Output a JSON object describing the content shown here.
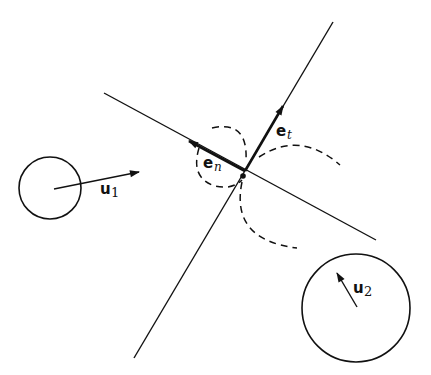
{
  "diagram": {
    "type": "collision-geometry",
    "colors": {
      "stroke": "#111111",
      "background": "#ffffff"
    },
    "labels": {
      "e_n": {
        "base": "e",
        "sub": "n"
      },
      "e_t": {
        "base": "e",
        "sub": "t"
      },
      "u_1": {
        "base": "u",
        "sub": "1"
      },
      "u_2": {
        "base": "u",
        "sub": "2"
      }
    },
    "elements": [
      {
        "id": "tangent-line",
        "kind": "line",
        "from": [
          104,
          93
        ],
        "to": [
          376,
          240
        ]
      },
      {
        "id": "normal-line",
        "kind": "line",
        "from": [
          333,
          22
        ],
        "to": [
          134,
          358
        ]
      },
      {
        "id": "vector-e_n",
        "kind": "arrow",
        "from": [
          245,
          171
        ],
        "to": [
          187,
          140
        ]
      },
      {
        "id": "vector-e_t",
        "kind": "arrow",
        "from": [
          245,
          171
        ],
        "to": [
          284,
          104
        ]
      },
      {
        "id": "particle-1",
        "kind": "circle",
        "center": [
          50,
          188
        ],
        "radius": 31
      },
      {
        "id": "velocity-u_1",
        "kind": "arrow",
        "from": [
          54,
          189
        ],
        "to": [
          141,
          172
        ]
      },
      {
        "id": "particle-2",
        "kind": "circle",
        "center": [
          356,
          308
        ],
        "radius": 54
      },
      {
        "id": "velocity-u_2",
        "kind": "arrow",
        "from": [
          357,
          307
        ],
        "to": [
          336,
          271
        ]
      },
      {
        "id": "contact-point",
        "kind": "dot",
        "center": [
          243,
          176
        ]
      },
      {
        "id": "dashed-arcs",
        "kind": "dashed-arc",
        "count": 4
      }
    ]
  }
}
